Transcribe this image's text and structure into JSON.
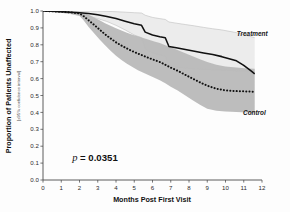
{
  "chart_data": {
    "type": "line",
    "title": "",
    "xlabel": "Months Post First Visit",
    "ylabel": "Proportion of Patients Unaffected",
    "ylabel_subtitle": "[±95% confidence interval]",
    "xlim": [
      0,
      12
    ],
    "ylim": [
      0,
      1.0
    ],
    "xticks": [
      "0",
      "1",
      "2",
      "3",
      "4",
      "5",
      "6",
      "7",
      "8",
      "9",
      "10",
      "11",
      "12"
    ],
    "yticks": [
      "0.0",
      "0.1",
      "0.2",
      "0.3",
      "0.4",
      "0.5",
      "0.6",
      "0.7",
      "0.8",
      "0.9",
      "1.0"
    ],
    "grid": false,
    "legend_position": "inline-annotation",
    "annotations": [
      {
        "name": "p-value",
        "italic_part": "p",
        "rest": " = 0.0351",
        "text": "p = 0.0351",
        "x": 1.6,
        "y": 0.115
      },
      {
        "name": "treatment-label",
        "text": "Treatment",
        "x": 11.1,
        "y": 0.855
      },
      {
        "name": "control-label",
        "text": "Control",
        "x": 11.0,
        "y": 0.385
      }
    ],
    "series": [
      {
        "name": "Treatment",
        "style": "solid",
        "color": "#111111",
        "band_color": "#ececec",
        "band_edge_color": "#b9b9b9",
        "x": [
          0,
          0.5,
          1.0,
          1.5,
          2.0,
          2.5,
          3.0,
          3.5,
          4.0,
          4.5,
          5.0,
          5.4,
          5.6,
          6.0,
          6.4,
          6.7,
          6.9,
          7.3,
          7.8,
          8.3,
          8.8,
          9.3,
          9.8,
          10.3,
          10.6,
          11.0,
          11.4,
          11.6
        ],
        "values": [
          1.0,
          0.998,
          0.996,
          0.993,
          0.99,
          0.985,
          0.978,
          0.968,
          0.955,
          0.94,
          0.925,
          0.915,
          0.875,
          0.858,
          0.848,
          0.842,
          0.79,
          0.782,
          0.772,
          0.762,
          0.752,
          0.742,
          0.73,
          0.715,
          0.705,
          0.678,
          0.645,
          0.628
        ],
        "band_upper": [
          1.0,
          1.0,
          1.0,
          1.0,
          1.0,
          1.0,
          0.999,
          0.998,
          0.996,
          0.993,
          0.99,
          0.988,
          0.975,
          0.962,
          0.955,
          0.95,
          0.935,
          0.928,
          0.92,
          0.912,
          0.903,
          0.895,
          0.888,
          0.878,
          0.872,
          0.86,
          0.848,
          0.842
        ],
        "band_lower": [
          1.0,
          0.996,
          0.992,
          0.986,
          0.98,
          0.97,
          0.955,
          0.938,
          0.915,
          0.888,
          0.858,
          0.842,
          0.775,
          0.752,
          0.74,
          0.732,
          0.675,
          0.668,
          0.662,
          0.658,
          0.655,
          0.652,
          0.65,
          0.648,
          0.646,
          0.645,
          0.644,
          0.643
        ]
      },
      {
        "name": "Control",
        "style": "dotted",
        "color": "#111111",
        "band_color": "#b9b9b9",
        "band_edge_color": "#9a9a9a",
        "x": [
          0,
          0.5,
          1.0,
          1.5,
          2.0,
          2.2,
          2.5,
          2.8,
          3.1,
          3.4,
          3.7,
          4.0,
          4.3,
          4.6,
          4.9,
          5.2,
          5.5,
          5.8,
          6.1,
          6.4,
          6.7,
          7.0,
          7.4,
          7.8,
          8.2,
          8.6,
          9.0,
          9.5,
          10.0,
          10.6,
          11.2,
          11.6
        ],
        "values": [
          1.0,
          0.998,
          0.996,
          0.992,
          0.985,
          0.972,
          0.945,
          0.918,
          0.89,
          0.862,
          0.838,
          0.815,
          0.795,
          0.778,
          0.762,
          0.748,
          0.735,
          0.722,
          0.71,
          0.698,
          0.682,
          0.665,
          0.645,
          0.622,
          0.6,
          0.578,
          0.558,
          0.54,
          0.53,
          0.526,
          0.524,
          0.522
        ],
        "band_upper": [
          1.0,
          1.0,
          1.0,
          0.999,
          0.996,
          0.99,
          0.978,
          0.962,
          0.945,
          0.928,
          0.912,
          0.898,
          0.885,
          0.872,
          0.86,
          0.85,
          0.84,
          0.83,
          0.82,
          0.81,
          0.798,
          0.785,
          0.768,
          0.75,
          0.732,
          0.715,
          0.698,
          0.682,
          0.672,
          0.665,
          0.66,
          0.658
        ],
        "band_lower": [
          1.0,
          0.995,
          0.99,
          0.982,
          0.97,
          0.948,
          0.905,
          0.868,
          0.832,
          0.798,
          0.765,
          0.735,
          0.71,
          0.688,
          0.668,
          0.65,
          0.635,
          0.62,
          0.605,
          0.59,
          0.572,
          0.552,
          0.528,
          0.5,
          0.472,
          0.445,
          0.422,
          0.41,
          0.405,
          0.402,
          0.4,
          0.398
        ]
      }
    ]
  }
}
